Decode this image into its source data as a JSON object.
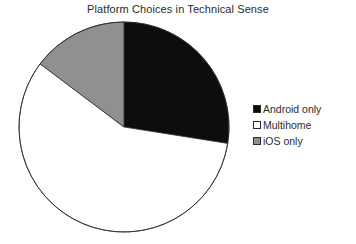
{
  "chart_data": {
    "type": "pie",
    "title": "Platform Choices in Technical Sense",
    "categories": [
      "Android only",
      "Multihome",
      "iOS only"
    ],
    "values": [
      27.5,
      58,
      14.5
    ],
    "unit": "percent",
    "start_angle": 0,
    "direction": "clockwise",
    "slice_colors": [
      "#0d0d0d",
      "#ffffff",
      "#909090"
    ],
    "slice_edge_color": "#2b2b2b",
    "legend_position": "right",
    "grid": false,
    "xlabel": "",
    "ylabel": "",
    "slices": [
      {
        "label": "Android only",
        "value": 27.5,
        "color": "#0d0d0d",
        "start_deg": 0,
        "end_deg": 99
      },
      {
        "label": "Multihome",
        "value": 58,
        "color": "#ffffff",
        "start_deg": 99,
        "end_deg": 307
      },
      {
        "label": "iOS only",
        "value": 14.5,
        "color": "#909090",
        "start_deg": 307,
        "end_deg": 360
      }
    ]
  },
  "title": {
    "text": "Platform Choices in Technical Sense"
  },
  "legend": {
    "items": [
      {
        "label": "Android only",
        "color": "#0d0d0d"
      },
      {
        "label": "Multihome",
        "color": "#ffffff"
      },
      {
        "label": "iOS only",
        "color": "#909090"
      }
    ]
  },
  "geometry": {
    "center_x": 124,
    "center_y": 127,
    "radius": 105
  }
}
